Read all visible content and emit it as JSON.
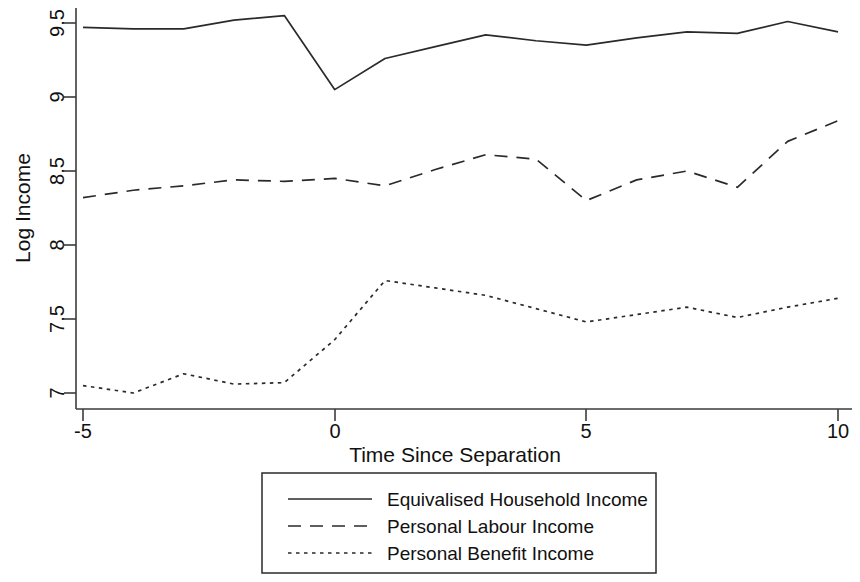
{
  "chart_data": {
    "type": "line",
    "title": "",
    "xlabel": "Time Since Separation",
    "ylabel": "Log Income",
    "x": [
      -5,
      -4,
      -3,
      -2,
      -1,
      0,
      1,
      2,
      3,
      4,
      5,
      6,
      7,
      8,
      9,
      10
    ],
    "xlim": [
      -5,
      10
    ],
    "ylim": [
      6.85,
      9.58
    ],
    "xticks": [
      -5,
      0,
      5,
      10
    ],
    "xtick_labels": [
      "-5",
      "0",
      "5",
      "10"
    ],
    "yticks": [
      7,
      7.5,
      8,
      8.5,
      9,
      9.5
    ],
    "ytick_labels": [
      "7",
      "7.5",
      "8",
      "8.5",
      "9",
      "9.5"
    ],
    "grid": false,
    "legend_position": "below-axes",
    "series": [
      {
        "name": "Equivalised Household Income",
        "style": "solid",
        "values": [
          9.47,
          9.46,
          9.46,
          9.52,
          9.55,
          9.05,
          9.26,
          9.34,
          9.42,
          9.38,
          9.35,
          9.4,
          9.44,
          9.43,
          9.51,
          9.44
        ]
      },
      {
        "name": "Personal Labour Income",
        "style": "dashed",
        "values": [
          8.32,
          8.37,
          8.4,
          8.44,
          8.43,
          8.45,
          8.4,
          8.51,
          8.61,
          8.58,
          8.3,
          8.44,
          8.5,
          8.39,
          8.7,
          8.84
        ]
      },
      {
        "name": "Personal Benefit Income",
        "style": "dotted",
        "values": [
          7.05,
          7.0,
          7.13,
          7.06,
          7.07,
          7.36,
          7.76,
          7.71,
          7.66,
          7.57,
          7.48,
          7.53,
          7.58,
          7.51,
          7.58,
          7.64
        ]
      }
    ]
  },
  "legend": {
    "entries": [
      {
        "label": "Equivalised Household Income",
        "style": "solid"
      },
      {
        "label": "Personal Labour Income",
        "style": "dashed"
      },
      {
        "label": "Personal Benefit Income",
        "style": "dotted"
      }
    ]
  },
  "axes": {
    "y_title": "Log Income",
    "x_title": "Time Since Separation"
  },
  "colors": {
    "line": "#2a2a2a",
    "axis": "#3b3b3b",
    "text": "#111111",
    "background": "#ffffff"
  }
}
